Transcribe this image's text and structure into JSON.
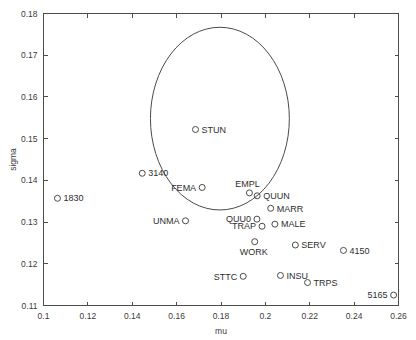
{
  "chart_data": {
    "type": "scatter",
    "title": "",
    "xlabel": "mu",
    "ylabel": "sigma",
    "xlim": [
      0.1,
      0.26
    ],
    "ylim": [
      0.11,
      0.18
    ],
    "xticks": [
      "0.1",
      "0.12",
      "0.14",
      "0.16",
      "0.18",
      "0.2",
      "0.22",
      "0.24",
      "0.26"
    ],
    "xtick_values": [
      0.1,
      0.12,
      0.14,
      0.16,
      0.18,
      0.2,
      0.22,
      0.24,
      0.26
    ],
    "yticks": [
      "0.11",
      "0.12",
      "0.13",
      "0.14",
      "0.15",
      "0.16",
      "0.17",
      "0.18"
    ],
    "ytick_values": [
      0.11,
      0.12,
      0.13,
      0.14,
      0.15,
      0.16,
      0.17,
      0.18
    ],
    "grid": false,
    "legend": "none",
    "marker_style": "open-circle",
    "points": [
      {
        "label": "STUN",
        "mu": 0.1685,
        "sigma": 0.1522,
        "label_side": "right"
      },
      {
        "label": "3140",
        "mu": 0.1445,
        "sigma": 0.1417,
        "label_side": "right"
      },
      {
        "label": "FEMA",
        "mu": 0.1715,
        "sigma": 0.1383,
        "label_side": "left"
      },
      {
        "label": "1830",
        "mu": 0.1063,
        "sigma": 0.1357,
        "label_side": "right"
      },
      {
        "label": "EMPL",
        "mu": 0.1928,
        "sigma": 0.137,
        "label_side": "above"
      },
      {
        "label": "QUUN",
        "mu": 0.1963,
        "sigma": 0.1363,
        "label_side": "right"
      },
      {
        "label": "MARR",
        "mu": 0.2024,
        "sigma": 0.1333,
        "label_side": "right"
      },
      {
        "label": "UNMA",
        "mu": 0.164,
        "sigma": 0.1303,
        "label_side": "left"
      },
      {
        "label": "QUU0",
        "mu": 0.1962,
        "sigma": 0.1307,
        "label_side": "left"
      },
      {
        "label": "TRAP",
        "mu": 0.1985,
        "sigma": 0.129,
        "label_side": "left"
      },
      {
        "label": "MALE",
        "mu": 0.2043,
        "sigma": 0.1295,
        "label_side": "right"
      },
      {
        "label": "WORK",
        "mu": 0.1952,
        "sigma": 0.1253,
        "label_side": "below"
      },
      {
        "label": "SERV",
        "mu": 0.2135,
        "sigma": 0.1245,
        "label_side": "right"
      },
      {
        "label": "4150",
        "mu": 0.2352,
        "sigma": 0.1232,
        "label_side": "right"
      },
      {
        "label": "STTC",
        "mu": 0.19,
        "sigma": 0.117,
        "label_side": "left"
      },
      {
        "label": "INSU",
        "mu": 0.2068,
        "sigma": 0.1172,
        "label_side": "right"
      },
      {
        "label": "TRPS",
        "mu": 0.219,
        "sigma": 0.1155,
        "label_side": "right"
      },
      {
        "label": "5165",
        "mu": 0.2578,
        "sigma": 0.1125,
        "label_side": "left"
      }
    ],
    "ellipse": {
      "center_mu": 0.1795,
      "center_sigma": 0.1548,
      "radius_mu": 0.0313,
      "radius_sigma": 0.0219
    }
  }
}
